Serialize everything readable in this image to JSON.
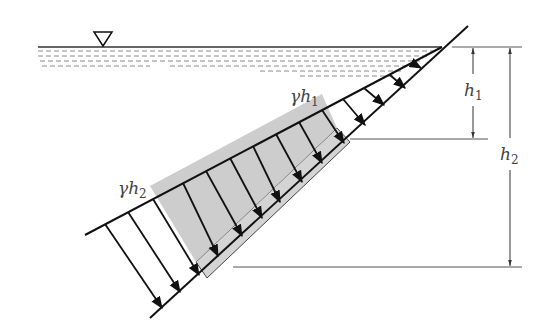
{
  "diagram": {
    "free_surface_symbol": "water-level-triangle",
    "labels": {
      "pressure_top": {
        "base": "γh",
        "sub": "1"
      },
      "pressure_bottom": {
        "base": "γh",
        "sub": "2"
      },
      "depth_top": {
        "base": "h",
        "sub": "1"
      },
      "depth_bottom": {
        "base": "h",
        "sub": "2"
      }
    },
    "colors": {
      "line": "#111111",
      "dim_line": "#444444",
      "gate_fill": "#d4d4d4",
      "pressure_shade": "#c8c8c8",
      "water_dash": "#888888"
    },
    "pressure_arrow_count": 13
  }
}
